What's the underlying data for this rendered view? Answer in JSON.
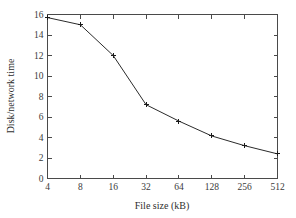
{
  "chart_data": {
    "type": "line",
    "title": "",
    "subtitle": "",
    "xlabel": "File size (kB)",
    "ylabel": "Disk/network time",
    "x": [
      4,
      8,
      16,
      32,
      64,
      128,
      256,
      512
    ],
    "xtick_labels": [
      "4",
      "8",
      "16",
      "32",
      "64",
      "128",
      "256",
      "512"
    ],
    "xscale": "log2",
    "values": [
      15.7,
      15.0,
      12.0,
      7.2,
      5.6,
      4.15,
      3.2,
      2.4
    ],
    "ytick_labels": [
      "0",
      "2",
      "4",
      "6",
      "8",
      "10",
      "12",
      "14",
      "16"
    ],
    "ytick_values": [
      0,
      2,
      4,
      6,
      8,
      10,
      12,
      14,
      16
    ],
    "ylim": [
      0,
      16
    ],
    "grid": false,
    "legend": null,
    "legend_position": "none",
    "marker": "plus",
    "line_color": "#2b2b2b",
    "axis_color": "#4a4a4a",
    "background_color": "#ffffff",
    "series": [
      {
        "name": "Disk/network time",
        "values": [
          15.7,
          15.0,
          12.0,
          7.2,
          5.6,
          4.15,
          3.2,
          2.4
        ]
      }
    ],
    "annotations": []
  }
}
